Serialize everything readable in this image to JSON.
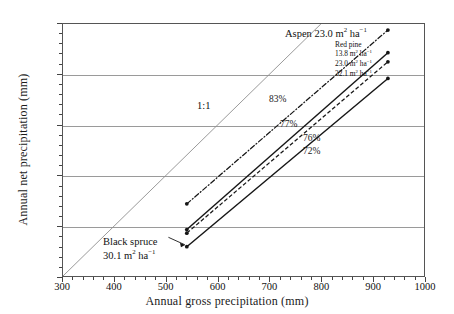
{
  "chart_data": {
    "type": "line",
    "title": "",
    "xlabel": "Annual gross precipitation (mm)",
    "ylabel": "Annual net precipitation (mm)",
    "xlim": [
      300,
      1000
    ],
    "ylim": [
      300,
      800
    ],
    "xticks": [
      300,
      400,
      500,
      600,
      700,
      800,
      900,
      1000
    ],
    "yticks": [
      300,
      400,
      500,
      600,
      700,
      800
    ],
    "xtick_labels": [
      "300",
      "400",
      "500",
      "600",
      "700",
      "800",
      "900",
      "1000"
    ],
    "ytick_labels": [
      "300",
      "400",
      "500",
      "600",
      "700",
      "800"
    ],
    "minor_tick_step": 20,
    "grid": "horizontal gridlines at 400, 500, 600, 700",
    "legend_position": "inside upper-right of plot area",
    "series": [
      {
        "name": "1:1",
        "label": "1:1",
        "style": "thin solid gray reference line",
        "slope_percent": 100,
        "x": [
          300,
          800
        ],
        "y": [
          300,
          800
        ],
        "markers": false
      },
      {
        "name": "Aspen 23.0 m2 ha-1",
        "label": "Aspen 23.0 m",
        "label_sup": "2",
        "label_tail": " ha",
        "label_tail_sup": "−1",
        "style": "dash-dot",
        "slope_percent": 83,
        "percent_label": "83%",
        "x": [
          540,
          930
        ],
        "y": [
          443,
          788
        ],
        "markers": true
      },
      {
        "name": "Red pine 13.8 m2 ha-1",
        "label": "13.8 m",
        "label_sup": "2",
        "label_tail": " ha",
        "label_tail_sup": "−1",
        "style": "solid",
        "slope_percent": 77,
        "percent_label": "77%",
        "x": [
          540,
          930
        ],
        "y": [
          392,
          743
        ],
        "markers": true
      },
      {
        "name": "Red pine 23.0 m2 ha-1",
        "label": "23.0 m",
        "label_sup": "2",
        "label_tail": " ha",
        "label_tail_sup": "−1",
        "style": "dashed",
        "slope_percent": 76,
        "percent_label": "76%",
        "x": [
          540,
          930
        ],
        "y": [
          385,
          725
        ],
        "markers": true
      },
      {
        "name": "Red pine 32.1 m2 ha-1",
        "label": "32.1 m",
        "label_sup": "2",
        "label_tail": " ha",
        "label_tail_sup": "−1",
        "style": "solid",
        "slope_percent": 72,
        "percent_label": "72%",
        "x": [
          540,
          930
        ],
        "y": [
          358,
          692
        ],
        "markers": true
      }
    ],
    "annotations": [
      {
        "text": "1:1",
        "x": 560,
        "y": 615
      },
      {
        "text": "83%",
        "x": 700,
        "y": 630
      },
      {
        "text": "77%",
        "x": 722,
        "y": 583
      },
      {
        "text": "76%",
        "x": 768,
        "y": 556
      },
      {
        "text": "72%",
        "x": 768,
        "y": 530
      },
      {
        "text": "Black spruce 30.1 m2 ha-1",
        "x": 470,
        "y": 370
      }
    ]
  },
  "axes": {
    "x_title": "Annual gross precipitation (mm)",
    "y_title": "Annual net precipitation (mm)",
    "x_ticks": [
      "300",
      "400",
      "500",
      "600",
      "700",
      "800",
      "900",
      "1000"
    ],
    "y_ticks": [
      "800",
      "700",
      "600",
      "500",
      "400",
      "300"
    ]
  },
  "annotations": {
    "one_to_one": "1:1",
    "aspen": {
      "text": "Aspen 23.0 m",
      "sup1": "2",
      "mid": " ha",
      "sup2": "−1"
    },
    "black_spruce": {
      "line1": "Black spruce",
      "line2": "30.1 m",
      "sup1": "2",
      "mid": " ha",
      "sup2": "−1"
    },
    "percents": {
      "p83": "83%",
      "p77": "77%",
      "p76": "76%",
      "p72": "72%"
    }
  },
  "legend": {
    "title": "Red pine",
    "rows": [
      {
        "value": "13.8 m",
        "sup1": "2",
        "mid": " ha",
        "sup2": "−1"
      },
      {
        "value": "23.0 m",
        "sup1": "2",
        "mid": " ha",
        "sup2": "−1"
      },
      {
        "value": "32.1 m",
        "sup1": "2",
        "mid": " ha",
        "sup2": "−1"
      }
    ]
  },
  "colors": {
    "line": "#161616",
    "reference": "#8d8d8d",
    "grid": "#9a9a9a",
    "frame": "#555555",
    "background": "#ffffff"
  }
}
